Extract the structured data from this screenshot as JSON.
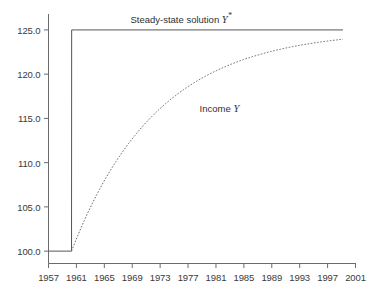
{
  "chart_data": {
    "type": "line",
    "title": "",
    "xlabel": "",
    "ylabel": "",
    "grid": false,
    "legend_position": "inline-annotations",
    "xlim": [
      1957,
      2001
    ],
    "ylim": [
      98.6,
      126.8
    ],
    "xticks": [
      1957,
      1961,
      1965,
      1969,
      1973,
      1977,
      1981,
      1985,
      1989,
      1993,
      1997,
      2001
    ],
    "xtick_labels": [
      "1957",
      "1961",
      "1965",
      "1969",
      "1973",
      "1977",
      "1981",
      "1985",
      "1989",
      "1993",
      "1997",
      "2001"
    ],
    "yticks": [
      100.0,
      105.0,
      110.0,
      115.0,
      120.0,
      125.0
    ],
    "ytick_labels": [
      "100.0",
      "105.0",
      "110.0",
      "115.0",
      "120.0",
      "125.0"
    ],
    "annotations": [
      {
        "name": "steady-state-label",
        "text_plain": "Steady-state solution Y*",
        "text_prefix": "Steady-state solution ",
        "text_symbol": "Y",
        "text_superscript": "*",
        "x": 1976.0,
        "y": 126.4
      },
      {
        "name": "income-label",
        "text_plain": "Income Y",
        "text_prefix": "Income ",
        "text_symbol": "Y",
        "text_superscript": "",
        "x": 1981.5,
        "y": 116.2
      }
    ],
    "series": [
      {
        "name": "Steady-state solution Y*",
        "style": "solid",
        "color": "#555555",
        "width": 1.0,
        "x": [
          1957.0,
          1960.3,
          1960.32,
          1961.0,
          1999.2
        ],
        "values": [
          100.0,
          100.0,
          125.0,
          125.0,
          125.0
        ]
      },
      {
        "name": "Income Y",
        "style": "dashed",
        "color": "#6a6a6a",
        "width": 1.0,
        "dash_pattern": "1.6 1.6",
        "x": [
          1960.3,
          1961,
          1962,
          1963,
          1964,
          1965,
          1966,
          1967,
          1968,
          1969,
          1970,
          1971,
          1972,
          1973,
          1974,
          1975,
          1976,
          1977,
          1978,
          1979,
          1980,
          1981,
          1982,
          1983,
          1984,
          1985,
          1986,
          1987,
          1988,
          1989,
          1990,
          1991,
          1992,
          1993,
          1994,
          1995,
          1996,
          1997,
          1998,
          1999.2
        ],
        "values": [
          100.0,
          101.95,
          104.16,
          106.19,
          108.06,
          109.78,
          111.36,
          112.81,
          114.14,
          115.37,
          116.5,
          117.53,
          118.48,
          119.36,
          120.16,
          120.9,
          121.58,
          122.2,
          122.77,
          123.3,
          123.78,
          124.23,
          124.63,
          125.01,
          125.36,
          125.68,
          125.97,
          126.24,
          126.49,
          126.72,
          126.93,
          127.12,
          127.3,
          127.47,
          127.62,
          127.76,
          127.89,
          128.01,
          128.12,
          128.23
        ]
      }
    ],
    "notes": {
      "income_asymptote": 125.0,
      "income_final_value": 123.95,
      "jump_year": 1960.3,
      "pre_shock_value": 100.0,
      "post_shock_steady_state": 125.0
    }
  },
  "axes": {
    "spine_color": "#6b6b6b",
    "tick_color": "#6b6b6b",
    "label_color": "#3a3a3a"
  }
}
